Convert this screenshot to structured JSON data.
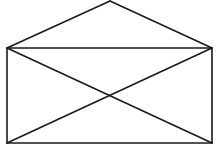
{
  "diagram": {
    "type": "line-drawing",
    "shape": "envelope",
    "stroke_color": "#1a1a1a",
    "background_color": "#ffffff",
    "stroke_width": 1.6,
    "vertices": {
      "apex": [
        110,
        1
      ],
      "top_left": [
        7,
        48
      ],
      "top_right": [
        212,
        48
      ],
      "bottom_left": [
        7,
        143
      ],
      "bottom_right": [
        212,
        143
      ],
      "center": [
        109,
        96
      ]
    },
    "segments": [
      {
        "name": "flap-left",
        "from": "apex",
        "to": "top_left"
      },
      {
        "name": "flap-right",
        "from": "apex",
        "to": "top_right"
      },
      {
        "name": "top-edge",
        "from": "top_left",
        "to": "top_right"
      },
      {
        "name": "left-edge",
        "from": "top_left",
        "to": "bottom_left"
      },
      {
        "name": "right-edge",
        "from": "top_right",
        "to": "bottom_right"
      },
      {
        "name": "bottom-edge",
        "from": "bottom_left",
        "to": "bottom_right"
      },
      {
        "name": "diagonal-tl-br",
        "from": "top_left",
        "to": "bottom_right"
      },
      {
        "name": "diagonal-tr-bl",
        "from": "top_right",
        "to": "bottom_left"
      }
    ]
  }
}
